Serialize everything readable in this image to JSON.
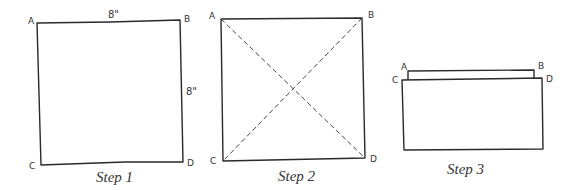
{
  "steps": [
    {
      "caption": "Step 1",
      "corners": {
        "a": "A",
        "b": "B",
        "c": "C",
        "d": "D"
      },
      "dimensions": {
        "top": "8\"",
        "right": "8\""
      }
    },
    {
      "caption": "Step 2",
      "corners": {
        "a": "A",
        "b": "B",
        "c": "C",
        "d": "D"
      }
    },
    {
      "caption": "Step 3",
      "corners": {
        "a": "A",
        "b": "B",
        "c": "C",
        "d": "D"
      }
    }
  ]
}
